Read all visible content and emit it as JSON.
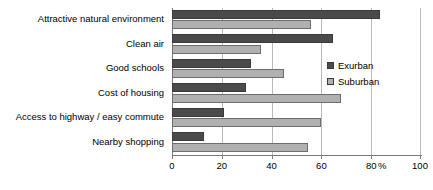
{
  "chart_data": {
    "type": "bar",
    "orientation": "horizontal",
    "title": "",
    "xlabel": "%",
    "ylabel": "",
    "xlim": [
      0,
      100
    ],
    "xticks": [
      0,
      20,
      40,
      60,
      80,
      100
    ],
    "xtick_labels": [
      "0",
      "20",
      "40",
      "60",
      "80",
      "100"
    ],
    "grid": true,
    "legend_position": "right",
    "categories": [
      "Attractive natural environment",
      "Clean air",
      "Good schools",
      "Cost of housing",
      "Access to highway / easy commute",
      "Nearby shopping"
    ],
    "series": [
      {
        "name": "Exurban",
        "color": "#4a4a4a",
        "values": [
          84,
          65,
          32,
          30,
          21,
          13
        ]
      },
      {
        "name": "Suburban",
        "color": "#b0b0b0",
        "values": [
          56,
          36,
          45,
          68,
          60,
          55
        ]
      }
    ]
  },
  "axis": {
    "percent_symbol": "%"
  }
}
